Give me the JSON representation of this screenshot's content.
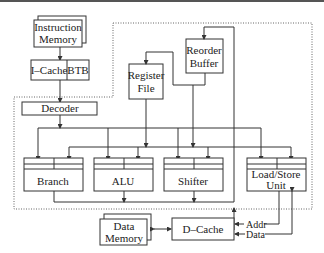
{
  "diagram": {
    "blocks": {
      "instruction_memory": [
        "Instruction",
        "Memory"
      ],
      "icache": "I–Cache",
      "btb": "BTB",
      "decoder": "Decoder",
      "register_file": [
        "Register",
        "File"
      ],
      "reorder_buffer": [
        "Reorder",
        "Buffer"
      ],
      "branch": "Branch",
      "alu": "ALU",
      "shifter": "Shifter",
      "load_store": [
        "Load/Store",
        "Unit"
      ],
      "data_memory": [
        "Data",
        "Memory"
      ],
      "dcache": "D–Cache"
    },
    "signals": {
      "addr": "Addr",
      "data": "Data"
    }
  }
}
